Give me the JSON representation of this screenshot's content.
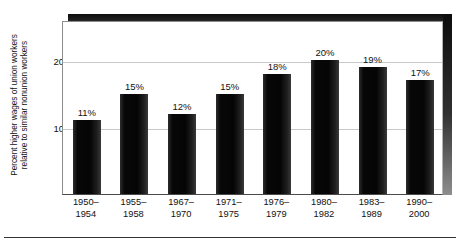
{
  "chart_data": {
    "type": "bar",
    "title": "",
    "xlabel": "",
    "ylabel_lines": [
      "Percent higher wages of union workers",
      "relative to similar nonunion workers"
    ],
    "ylabel": "Percent higher wages of union workers relative to similar nonunion workers",
    "categories": [
      "1950–1954",
      "1955–1958",
      "1967–1970",
      "1971–1975",
      "1976–1979",
      "1980–1982",
      "1983–1989",
      "1990–2000"
    ],
    "category_lines": [
      [
        "1950–",
        "1954"
      ],
      [
        "1955–",
        "1958"
      ],
      [
        "1967–",
        "1970"
      ],
      [
        "1971–",
        "1975"
      ],
      [
        "1976–",
        "1979"
      ],
      [
        "1980–",
        "1982"
      ],
      [
        "1983–",
        "1989"
      ],
      [
        "1990–",
        "2000"
      ]
    ],
    "values": [
      11,
      15,
      12,
      15,
      18,
      20,
      19,
      17
    ],
    "data_labels": [
      "11%",
      "15%",
      "12%",
      "15%",
      "18%",
      "20%",
      "19%",
      "17%"
    ],
    "ylim": [
      0,
      26
    ],
    "yticks": [
      10,
      20
    ],
    "ytick_labels": [
      "10",
      "20"
    ],
    "grid": "horizontal",
    "legend": "none",
    "bar_color": "#0a0a0a",
    "gridline_color": "#c9c9c9",
    "shadow_color": "#121212",
    "background_color": "#ffffff"
  }
}
